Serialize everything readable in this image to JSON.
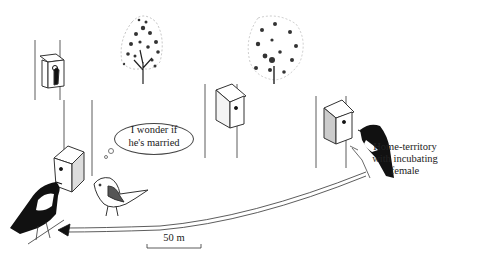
{
  "figure": {
    "type": "illustration",
    "thought_bubble": {
      "line1": "I wonder if",
      "line2": "he's married"
    },
    "home_label": {
      "line1": "Home-territory",
      "line2": "with incubating",
      "line3": "female"
    },
    "scale_bar": {
      "label": "50 m"
    },
    "elements": [
      {
        "name": "tree-left",
        "kind": "tree"
      },
      {
        "name": "tree-right",
        "kind": "tree"
      },
      {
        "name": "nestbox-far-left",
        "kind": "nest box",
        "occupied": true
      },
      {
        "name": "nestbox-center",
        "kind": "nest box"
      },
      {
        "name": "nestbox-home",
        "kind": "nest box"
      },
      {
        "name": "nestbox-foreground",
        "kind": "nest box"
      },
      {
        "name": "male-bird-home",
        "kind": "male pied flycatcher"
      },
      {
        "name": "male-bird-secondary",
        "kind": "male pied flycatcher"
      },
      {
        "name": "female-bird",
        "kind": "female pied flycatcher"
      },
      {
        "name": "travel-arrow",
        "kind": "arrow",
        "direction": "from home territory to secondary territory"
      }
    ],
    "colors": {
      "ink": "#1a1a1a",
      "background": "#ffffff"
    }
  }
}
